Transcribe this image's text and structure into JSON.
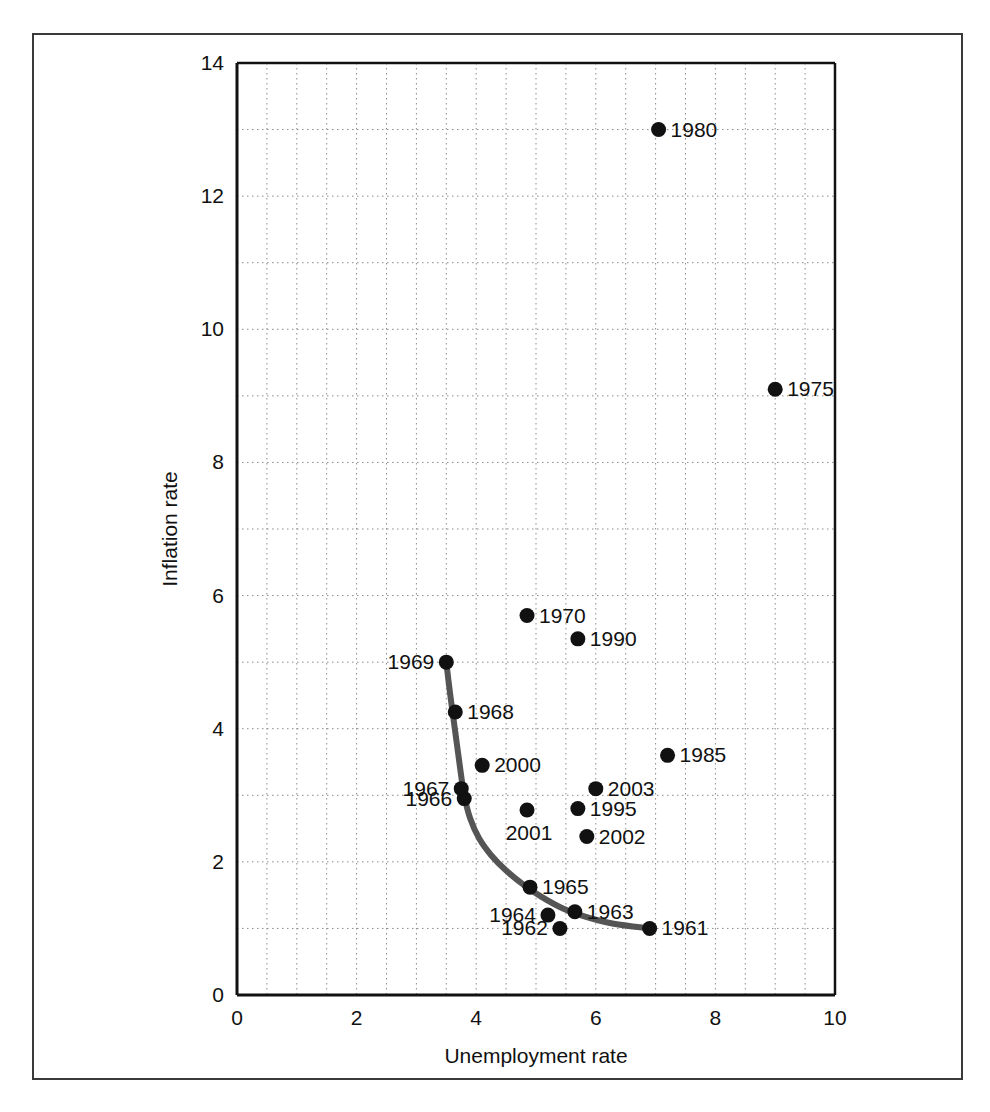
{
  "chart_data": {
    "type": "scatter",
    "title": "",
    "xlabel": "Unemployment rate",
    "ylabel": "Inflation rate",
    "xlim": [
      0,
      10
    ],
    "ylim": [
      0,
      14
    ],
    "xticks": [
      0,
      2,
      4,
      6,
      8,
      10
    ],
    "yticks": [
      0,
      2,
      4,
      6,
      8,
      10,
      12,
      14
    ],
    "xtick_labels": [
      "0",
      "2",
      "4",
      "6",
      "8",
      "10"
    ],
    "ytick_labels": [
      "0",
      "2",
      "4",
      "6",
      "8",
      "10",
      "12",
      "14"
    ],
    "grid": true,
    "grid_style": "dotted",
    "x_minor_step": 0.5,
    "y_minor_step": 1,
    "legend": "none",
    "marker_color": "#111111",
    "curve_color": "#555555",
    "points": [
      {
        "label": "1961",
        "x": 6.9,
        "y": 1.0,
        "label_pos": "right"
      },
      {
        "label": "1962",
        "x": 5.4,
        "y": 1.0,
        "label_pos": "left"
      },
      {
        "label": "1963",
        "x": 5.65,
        "y": 1.25,
        "label_pos": "right"
      },
      {
        "label": "1964",
        "x": 5.2,
        "y": 1.2,
        "label_pos": "left"
      },
      {
        "label": "1965",
        "x": 4.9,
        "y": 1.62,
        "label_pos": "right"
      },
      {
        "label": "1966",
        "x": 3.8,
        "y": 2.95,
        "label_pos": "left"
      },
      {
        "label": "1967",
        "x": 3.75,
        "y": 3.1,
        "label_pos": "left"
      },
      {
        "label": "1968",
        "x": 3.65,
        "y": 4.25,
        "label_pos": "right"
      },
      {
        "label": "1969",
        "x": 3.5,
        "y": 5.0,
        "label_pos": "left"
      },
      {
        "label": "1970",
        "x": 4.85,
        "y": 5.7,
        "label_pos": "right"
      },
      {
        "label": "1975",
        "x": 9.0,
        "y": 9.1,
        "label_pos": "right"
      },
      {
        "label": "1980",
        "x": 7.05,
        "y": 13.0,
        "label_pos": "right"
      },
      {
        "label": "1985",
        "x": 7.2,
        "y": 3.6,
        "label_pos": "right"
      },
      {
        "label": "1990",
        "x": 5.7,
        "y": 5.35,
        "label_pos": "right"
      },
      {
        "label": "1995",
        "x": 5.7,
        "y": 2.8,
        "label_pos": "right"
      },
      {
        "label": "2000",
        "x": 4.1,
        "y": 3.45,
        "label_pos": "right"
      },
      {
        "label": "2001",
        "x": 4.85,
        "y": 2.78,
        "label_pos": "below"
      },
      {
        "label": "2002",
        "x": 5.85,
        "y": 2.38,
        "label_pos": "right"
      },
      {
        "label": "2003",
        "x": 6.0,
        "y": 3.1,
        "label_pos": "right"
      }
    ],
    "curve": {
      "name": "phillips-curve",
      "points": [
        [
          3.5,
          5.0
        ],
        [
          3.56,
          4.55
        ],
        [
          3.62,
          4.15
        ],
        [
          3.68,
          3.75
        ],
        [
          3.74,
          3.35
        ],
        [
          3.8,
          3.0
        ],
        [
          3.9,
          2.65
        ],
        [
          4.05,
          2.35
        ],
        [
          4.25,
          2.1
        ],
        [
          4.5,
          1.87
        ],
        [
          4.8,
          1.65
        ],
        [
          5.1,
          1.47
        ],
        [
          5.45,
          1.3
        ],
        [
          5.85,
          1.17
        ],
        [
          6.3,
          1.07
        ],
        [
          6.9,
          1.0
        ]
      ]
    }
  }
}
